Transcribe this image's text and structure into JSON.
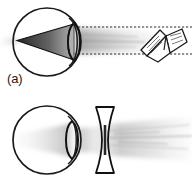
{
  "figure": {
    "background_color": "#ffffff",
    "ink_color": "#1a1a1a",
    "width": 192,
    "height": 191
  },
  "panels": [
    {
      "id": "a",
      "label": "(a)",
      "caption": "Uncorrected myopic eye: light from the book converges to a focus in front of the retina",
      "elements": {
        "eyeball": {
          "name": "eyeball-circle",
          "cx": 47,
          "cy": 42,
          "r": 34
        },
        "eye_lens": {
          "name": "eye-lens-convex",
          "cx": 74,
          "cy": 42,
          "half_width": 8,
          "half_height": 19
        },
        "focus_cone": {
          "name": "converging-ray-cone",
          "apex_x": 17,
          "apex_y": 40
        },
        "beam": {
          "name": "blurred-light-beam"
        },
        "dashed_lines": [
          {
            "name": "chief-ray-upper-dashed",
            "y": 27
          },
          {
            "name": "chief-ray-lower-dashed",
            "y": 54
          }
        ],
        "object": {
          "name": "open-book-object",
          "cx": 163,
          "cy": 45
        }
      }
    },
    {
      "id": "b",
      "label": "(b)",
      "caption": "Corrected myopic eye: a biconcave diverging lens spreads the incoming light",
      "elements": {
        "eyeball": {
          "name": "eyeball-circle",
          "cx": 47,
          "cy": 45,
          "r": 34
        },
        "eye_lens": {
          "name": "eye-lens-convex",
          "cx": 72,
          "cy": 45,
          "half_width": 8,
          "half_height": 19
        },
        "correcting_lens": {
          "name": "biconcave-diverging-lens",
          "cx": 105,
          "cy": 45,
          "half_width": 9,
          "half_height": 33
        },
        "beam": {
          "name": "blurred-light-beam"
        }
      }
    }
  ],
  "colors": {
    "ink": "#1a1a1a",
    "beam_dark": "#5a5a5a",
    "beam_light": "#c9c9c9",
    "background": "#ffffff"
  }
}
